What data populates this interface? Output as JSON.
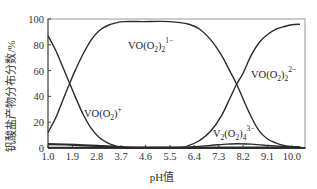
{
  "chart_data": {
    "type": "line",
    "title": "",
    "xlabel": "pH值",
    "ylabel": "钒酸盐产物分布分数/%",
    "xlim": [
      1.0,
      10.5
    ],
    "ylim": [
      0,
      100
    ],
    "x_ticks": [
      "1.0",
      "1.9",
      "2.8",
      "3.7",
      "4.6",
      "5.5",
      "6.4",
      "7.3",
      "8.2",
      "9.1",
      "10.0"
    ],
    "y_ticks": [
      "0",
      "20",
      "40",
      "60",
      "80",
      "100"
    ],
    "grid": false,
    "legend": "inline labels",
    "series": [
      {
        "name": "VO(O2)+",
        "label_parts": {
          "base": "VO(O",
          "sub": "2",
          "close": ")",
          "sup": "+"
        },
        "x": [
          1.0,
          1.3,
          1.6,
          1.8,
          2.0,
          2.3,
          2.6,
          2.9,
          3.2,
          3.5,
          3.7,
          4.0,
          10.5
        ],
        "values": [
          87,
          75,
          60,
          50,
          40,
          26,
          15,
          8,
          4,
          1.5,
          0.5,
          0,
          0
        ]
      },
      {
        "name": "VO(O2)2 1-",
        "label_parts": {
          "base": "VO(O",
          "sub": "2",
          "close": ")",
          "sub2": "2",
          "sup": "1−"
        },
        "x": [
          1.0,
          1.3,
          1.6,
          1.8,
          2.0,
          2.3,
          2.6,
          2.9,
          3.2,
          3.5,
          3.8,
          4.5,
          5.5,
          6.2,
          6.6,
          7.0,
          7.4,
          7.7,
          7.95,
          8.2,
          8.5,
          8.8,
          9.1,
          9.4,
          9.7,
          10.0,
          10.3,
          10.5
        ],
        "values": [
          12,
          24,
          40,
          50,
          60,
          73,
          84,
          91,
          95,
          97,
          98,
          98,
          98,
          96,
          92,
          84,
          72,
          60,
          50,
          38,
          24,
          13,
          7,
          4,
          2,
          1,
          0.5,
          0.3
        ]
      },
      {
        "name": "VO(O2)2 2-",
        "label_parts": {
          "base": "VO(O",
          "sub": "2",
          "close": ")",
          "sub2": "2",
          "sup": "2−"
        },
        "x": [
          1.0,
          5.5,
          6.2,
          6.6,
          7.0,
          7.4,
          7.7,
          7.95,
          8.2,
          8.5,
          8.8,
          9.1,
          9.4,
          9.7,
          10.0,
          10.3
        ],
        "values": [
          0,
          0,
          2,
          6,
          13,
          25,
          38,
          49,
          58,
          72,
          82,
          88,
          92,
          94,
          95.5,
          96
        ]
      },
      {
        "name": "V2(O2)4 3-",
        "label_parts": {
          "base": "V",
          "sub0": "2",
          "mid": "(O",
          "sub": "2",
          "close": ")",
          "sub2": "4",
          "sup": "3−"
        },
        "x": [
          1.0,
          5.5,
          6.4,
          7.0,
          7.6,
          8.0,
          8.5,
          9.0,
          9.5,
          10.0,
          10.3
        ],
        "values": [
          0.5,
          0.5,
          1,
          2,
          3,
          3.3,
          3,
          2.2,
          1.5,
          1,
          0.8
        ]
      },
      {
        "name": "low-level baseline species",
        "x": [
          1.0,
          2.0,
          3.0,
          3.7,
          4.5,
          10.3
        ],
        "values": [
          3,
          2.5,
          1.5,
          0.8,
          0.3,
          0.2
        ]
      }
    ]
  }
}
